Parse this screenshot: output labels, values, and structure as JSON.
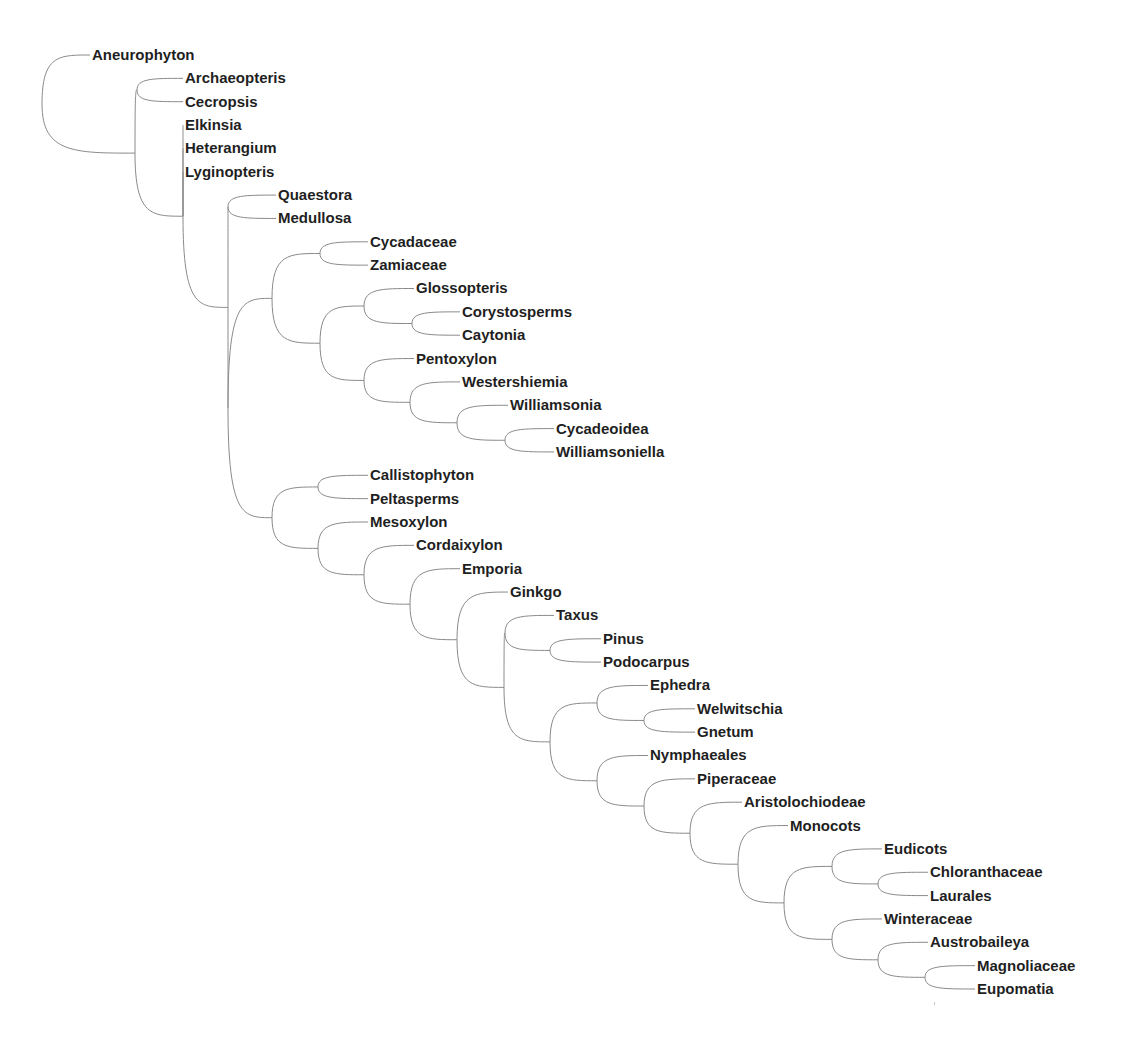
{
  "diagram": {
    "type": "cladogram",
    "style": "curved-branches",
    "row_start_y": 55,
    "row_spacing": 23.35,
    "line_color": "#8a8a8a",
    "text_color": "#1f1f1f",
    "tree": {
      "x": 42,
      "children": [
        {
          "label": "Aneurophyton",
          "x": 90
        },
        {
          "x": 135,
          "children": [
            {
              "x": 137,
              "children": [
                {
                  "label": "Archaeopteris",
                  "x": 183
                },
                {
                  "label": "Cecropsis",
                  "x": 183
                }
              ]
            },
            {
              "x": 183,
              "children": [
                {
                  "label": "Elkinsia",
                  "x": 183
                },
                {
                  "label": "Heterangium",
                  "x": 183
                },
                {
                  "label": "Lyginopteris",
                  "x": 183
                },
                {
                  "x": 228,
                  "children": [
                    {
                      "x": 228,
                      "children": [
                        {
                          "label": "Quaestora",
                          "x": 276
                        },
                        {
                          "label": "Medullosa",
                          "x": 276
                        }
                      ]
                    },
                    {
                      "x": 228,
                      "children": [
                        {
                          "x": 272,
                          "children": [
                            {
                              "x": 320,
                              "children": [
                                {
                                  "label": "Cycadaceae",
                                  "x": 368
                                },
                                {
                                  "label": "Zamiaceae",
                                  "x": 368
                                }
                              ]
                            },
                            {
                              "x": 320,
                              "children": [
                                {
                                  "x": 364,
                                  "children": [
                                    {
                                      "label": "Glossopteris",
                                      "x": 414
                                    },
                                    {
                                      "x": 412,
                                      "children": [
                                        {
                                          "label": "Corystosperms",
                                          "x": 460
                                        },
                                        {
                                          "label": "Caytonia",
                                          "x": 460
                                        }
                                      ]
                                    }
                                  ]
                                },
                                {
                                  "x": 364,
                                  "children": [
                                    {
                                      "label": "Pentoxylon",
                                      "x": 414
                                    },
                                    {
                                      "x": 410,
                                      "children": [
                                        {
                                          "label": "Westershiemia",
                                          "x": 460
                                        },
                                        {
                                          "x": 457,
                                          "children": [
                                            {
                                              "label": "Williamsonia",
                                              "x": 508
                                            },
                                            {
                                              "x": 505,
                                              "children": [
                                                {
                                                  "label": "Cycadeoidea",
                                                  "x": 554
                                                },
                                                {
                                                  "label": "Williamsoniella",
                                                  "x": 554
                                                }
                                              ]
                                            }
                                          ]
                                        }
                                      ]
                                    }
                                  ]
                                }
                              ]
                            }
                          ]
                        },
                        {
                          "x": 272,
                          "children": [
                            {
                              "x": 318,
                              "children": [
                                {
                                  "label": "Callistophyton",
                                  "x": 368
                                },
                                {
                                  "label": "Peltasperms",
                                  "x": 368
                                }
                              ]
                            },
                            {
                              "x": 318,
                              "children": [
                                {
                                  "label": "Mesoxylon",
                                  "x": 368
                                },
                                {
                                  "x": 364,
                                  "children": [
                                    {
                                      "label": "Cordaixylon",
                                      "x": 414
                                    },
                                    {
                                      "x": 410,
                                      "children": [
                                        {
                                          "label": "Emporia",
                                          "x": 460
                                        },
                                        {
                                          "x": 457,
                                          "children": [
                                            {
                                              "label": "Ginkgo",
                                              "x": 508
                                            },
                                            {
                                              "x": 504,
                                              "children": [
                                                {
                                                  "x": 505,
                                                  "children": [
                                                    {
                                                      "label": "Taxus",
                                                      "x": 554
                                                    },
                                                    {
                                                      "x": 550,
                                                      "children": [
                                                        {
                                                          "label": "Pinus",
                                                          "x": 601
                                                        },
                                                        {
                                                          "label": "Podocarpus",
                                                          "x": 601
                                                        }
                                                      ]
                                                    }
                                                  ]
                                                },
                                                {
                                                  "x": 550,
                                                  "children": [
                                                    {
                                                      "x": 597,
                                                      "children": [
                                                        {
                                                          "label": "Ephedra",
                                                          "x": 648
                                                        },
                                                        {
                                                          "x": 644,
                                                          "children": [
                                                            {
                                                              "label": "Welwitschia",
                                                              "x": 695
                                                            },
                                                            {
                                                              "label": "Gnetum",
                                                              "x": 695
                                                            }
                                                          ]
                                                        }
                                                      ]
                                                    },
                                                    {
                                                      "x": 597,
                                                      "children": [
                                                        {
                                                          "label": "Nymphaeales",
                                                          "x": 648
                                                        },
                                                        {
                                                          "x": 644,
                                                          "children": [
                                                            {
                                                              "label": "Piperaceae",
                                                              "x": 695
                                                            },
                                                            {
                                                              "x": 690,
                                                              "children": [
                                                                {
                                                                  "label": "Aristolochiodeae",
                                                                  "x": 742
                                                                },
                                                                {
                                                                  "x": 738,
                                                                  "children": [
                                                                    {
                                                                      "label": "Monocots",
                                                                      "x": 788
                                                                    },
                                                                    {
                                                                      "x": 784,
                                                                      "children": [
                                                                        {
                                                                          "x": 832,
                                                                          "children": [
                                                                            {
                                                                              "label": "Eudicots",
                                                                              "x": 882
                                                                            },
                                                                            {
                                                                              "x": 878,
                                                                              "children": [
                                                                                {
                                                                                  "label": "Chloranthaceae",
                                                                                  "x": 928
                                                                                },
                                                                                {
                                                                                  "label": "Laurales",
                                                                                  "x": 928
                                                                                }
                                                                              ]
                                                                            }
                                                                          ]
                                                                        },
                                                                        {
                                                                          "x": 832,
                                                                          "children": [
                                                                            {
                                                                              "label": "Winteraceae",
                                                                              "x": 882
                                                                            },
                                                                            {
                                                                              "x": 878,
                                                                              "children": [
                                                                                {
                                                                                  "label": "Austrobaileya",
                                                                                  "x": 928
                                                                                },
                                                                                {
                                                                                  "x": 925,
                                                                                  "children": [
                                                                                    {
                                                                                      "label": "Magnoliaceae",
                                                                                      "x": 975
                                                                                    },
                                                                                    {
                                                                                      "label": "Eupomatia",
                                                                                      "x": 975
                                                                                    }
                                                                                  ]
                                                                                }
                                                                              ]
                                                                            }
                                                                          ]
                                                                        }
                                                                      ]
                                                                    }
                                                                  ]
                                                                }
                                                              ]
                                                            }
                                                          ]
                                                        }
                                                      ]
                                                    }
                                                  ]
                                                }
                                              ]
                                            }
                                          ]
                                        }
                                      ]
                                    }
                                  ]
                                }
                              ]
                            }
                          ]
                        }
                      ]
                    }
                  ]
                }
              ]
            }
          ]
        }
      ]
    },
    "taxa": [
      "Aneurophyton",
      "Archaeopteris",
      "Cecropsis",
      "Elkinsia",
      "Heterangium",
      "Lyginopteris",
      "Quaestora",
      "Medullosa",
      "Cycadaceae",
      "Zamiaceae",
      "Glossopteris",
      "Corystosperms",
      "Caytonia",
      "Pentoxylon",
      "Westershiemia",
      "Williamsonia",
      "Cycadeoidea",
      "Williamsoniella",
      "Callistophyton",
      "Peltasperms",
      "Mesoxylon",
      "Cordaixylon",
      "Emporia",
      "Ginkgo",
      "Taxus",
      "Pinus",
      "Podocarpus",
      "Ephedra",
      "Welwitschia",
      "Gnetum",
      "Nymphaeales",
      "Piperaceae",
      "Aristolochiodeae",
      "Monocots",
      "Eudicots",
      "Chloranthaceae",
      "Laurales",
      "Winteraceae",
      "Austrobaileya",
      "Magnoliaceae",
      "Eupomatia"
    ]
  }
}
